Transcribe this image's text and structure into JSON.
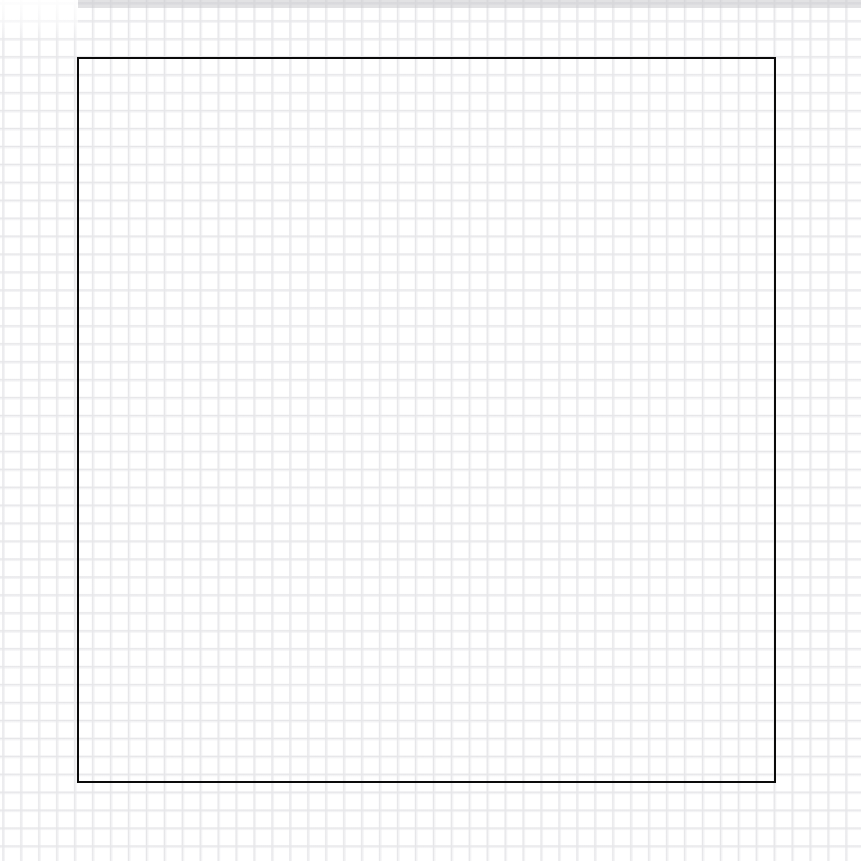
{
  "page": {
    "width": 861,
    "height": 861,
    "background_color": "#ffffff"
  },
  "paper": {
    "name": "graph-paper",
    "grid_color": "#e2e2e4",
    "grid_cell_px": 18,
    "grid_offset_px": 3,
    "highlight_note": "",
    "top_band_color": "#cbcbce",
    "top_band_height_px": 8
  },
  "shapes": [
    {
      "name": "square-outline",
      "type": "rectangle",
      "stroke_color": "#0a0a0a",
      "stroke_width_px": 3,
      "fill": "none",
      "x": 77,
      "y": 57,
      "width": 699,
      "height": 726,
      "label": ""
    }
  ],
  "annotations": {
    "caption": "",
    "note": ""
  }
}
